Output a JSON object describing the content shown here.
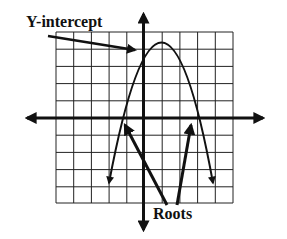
{
  "diagram": {
    "type": "parabola-graph",
    "labels": {
      "y_intercept": "Y-intercept",
      "roots": "Roots"
    },
    "grid": {
      "columns": 10,
      "rows": 10
    },
    "parabola": {
      "opens": "down",
      "vertex_grid": [
        1,
        5
      ],
      "roots_grid": [
        -1.2,
        3.2
      ]
    },
    "colors": {
      "ink": "#111111",
      "grid": "#222222",
      "background": "#ffffff"
    }
  }
}
